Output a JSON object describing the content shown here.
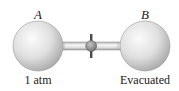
{
  "flasks": [
    {
      "name": "A",
      "state": "1 atm"
    },
    {
      "name": "B",
      "state": "Evacuated"
    }
  ],
  "colors": {
    "flask_fill": "#d9d9d9",
    "flask_highlight": "#f7f7f7",
    "flask_shadow": "#a6a6a6",
    "tube": "#c8c8c8",
    "stopcock": "#8c8c8c",
    "handle": "#4a4a4a",
    "text": "#222222"
  }
}
